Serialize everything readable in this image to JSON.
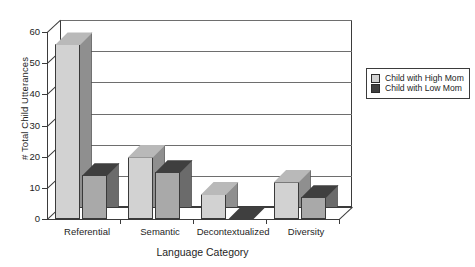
{
  "chart_data": {
    "type": "bar",
    "title": "",
    "xlabel": "Language Category",
    "ylabel": "# Total Child Utterances",
    "categories": [
      "Referential",
      "Semantic",
      "Decontextualized",
      "Diversity"
    ],
    "series": [
      {
        "name": "Child with High Mom",
        "values": [
          56,
          20,
          8,
          12
        ],
        "color": "#d2d2d2"
      },
      {
        "name": "Child with Low Mom",
        "values": [
          14,
          15,
          0,
          7
        ],
        "color": "#a9a9a9"
      }
    ],
    "ylim": [
      0,
      60
    ],
    "yticks": [
      0,
      10,
      20,
      30,
      40,
      50,
      60
    ],
    "ytick_labels": [
      "0",
      "10",
      "20",
      "30",
      "40",
      "50",
      "60"
    ],
    "grid": true,
    "legend_position": "right",
    "style": "3d-column",
    "colors": {
      "series_high_front": "#d2d2d2",
      "series_high_side": "#8f8f8f",
      "series_high_top": "#b9b9b9",
      "series_low_front": "#a9a9a9",
      "series_low_side": "#6b6b6b",
      "series_low_top": "#3f3f3f",
      "axis": "#3b3b3b",
      "gridline": "#6e6e6e",
      "background": "#ffffff"
    }
  },
  "legend": {
    "entries": [
      {
        "label": "Child with High Mom",
        "swatch": "#d2d2d2"
      },
      {
        "label": "Child with Low Mom",
        "swatch": "#3f3f3f"
      }
    ]
  }
}
